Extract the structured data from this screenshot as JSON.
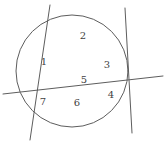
{
  "figure": {
    "canvas": {
      "width": 165,
      "height": 145
    },
    "background_color": "#ffffff",
    "stroke_color": "#5d5d5d",
    "label_color": "#3f3f3f",
    "stroke_width": 1
  },
  "circle": {
    "name": "main-circle",
    "cx": 72,
    "cy": 71,
    "r": 56
  },
  "lines": [
    {
      "name": "line-a",
      "description": "steep diagonal from top to bottom-left",
      "x1": 50,
      "y1": 5,
      "x2": 30,
      "y2": 140
    },
    {
      "name": "line-b",
      "description": "diagonal from top-right to bottom-right",
      "x1": 125,
      "y1": 8,
      "x2": 132,
      "y2": 133
    },
    {
      "name": "line-c",
      "description": "near-horizontal secant from left edge to right edge",
      "x1": 3,
      "y1": 94,
      "x2": 163,
      "y2": 76
    }
  ],
  "labels": [
    {
      "name": "region-label-1",
      "text": "1",
      "x": 44,
      "y": 62
    },
    {
      "name": "region-label-2",
      "text": "2",
      "x": 83,
      "y": 36
    },
    {
      "name": "region-label-3",
      "text": "3",
      "x": 107,
      "y": 65
    },
    {
      "name": "region-label-4",
      "text": "4",
      "x": 111,
      "y": 95
    },
    {
      "name": "region-label-5",
      "text": "5",
      "x": 84,
      "y": 80
    },
    {
      "name": "region-label-6",
      "text": "6",
      "x": 77,
      "y": 103
    },
    {
      "name": "region-label-7",
      "text": "7",
      "x": 43,
      "y": 102
    }
  ]
}
